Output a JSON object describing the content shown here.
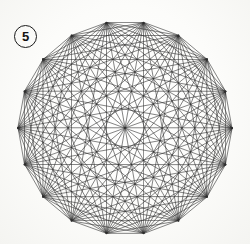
{
  "figure": {
    "label_number": "5",
    "label_shape": "circle",
    "caption": ""
  },
  "canvas": {
    "width": 250,
    "height": 244,
    "background_color": "#fbfbf9"
  },
  "chart_data": {
    "type": "diagram",
    "title": "",
    "subtitle": "",
    "xlabel": "",
    "ylabel": "",
    "graph_name": "K18",
    "vertex_count": 18,
    "edge_count": 153,
    "polygon_sides": 18,
    "all_pairs_connected": true,
    "center": [
      125,
      128
    ],
    "circumradius": 107,
    "rotation_degrees": 10,
    "line_color": "#2e2e2e",
    "line_width": 0.65,
    "grid": false,
    "legend": false,
    "vertices": [
      [
        96.4,
        22.6
      ],
      [
        147.1,
        21.4
      ],
      [
        192.5,
        44.4
      ],
      [
        222.9,
        83.4
      ],
      [
        231.8,
        132.1
      ],
      [
        217.4,
        179.4
      ],
      [
        182.9,
        214.6
      ],
      [
        135.9,
        229.9
      ],
      [
        86.6,
        226.0
      ],
      [
        45.2,
        203.3
      ],
      [
        19.7,
        163.2
      ],
      [
        18.2,
        114.4
      ],
      [
        41.2,
        72.9
      ],
      [
        81.0,
        42.2
      ],
      [
        0,
        0
      ],
      [
        0,
        0
      ],
      [
        0,
        0
      ],
      [
        0,
        0
      ]
    ],
    "note_on_vertices": "Vertices are generated procedurally from center, circumradius and rotation; the sample list above records measured screen positions of the outer hull points."
  }
}
